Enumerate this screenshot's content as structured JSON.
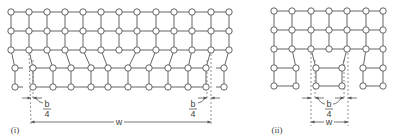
{
  "figure": {
    "colors": {
      "line": "#555555",
      "atom_fill": "#ffffff",
      "dashed": "#777777",
      "text": "#444444"
    },
    "panels": [
      {
        "id": "i",
        "label": "(i)",
        "label_pos": [
          15,
          133
        ],
        "atom_radius": 3.2,
        "rows": [
          {
            "y": 12,
            "x": [
              11,
              29,
              47,
              65,
              83,
              101,
              119,
              137,
              156,
              174,
              192,
              211,
              229
            ]
          },
          {
            "y": 31,
            "x": [
              11,
              29,
              47,
              65,
              83,
              101,
              119,
              137,
              156,
              174,
              192,
              211,
              229
            ]
          },
          {
            "y": 50,
            "x": [
              11,
              29,
              47,
              65,
              83,
              101,
              119,
              137,
              156,
              174,
              192,
              211,
              229
            ]
          },
          {
            "y": 68,
            "x": [
              15,
              33,
              53,
              71,
              91,
              108,
              128,
              149,
              168,
              188,
              206,
              224
            ]
          },
          {
            "y": 87,
            "x": [
              15,
              33,
              53,
              71,
              91,
              108,
              128,
              149,
              168,
              188,
              206,
              224
            ]
          }
        ],
        "row_gaps": [
          [],
          [],
          [],
          [
            0,
            10
          ],
          [
            0,
            10
          ]
        ],
        "gap_stubs": [
          {
            "x1": 15,
            "x2": 23,
            "rows": [
              3,
              4
            ]
          },
          {
            "x1": 216,
            "x2": 224,
            "rows": [
              3,
              4
            ]
          }
        ],
        "vertical_links_3_to_4": [
          [
            0,
            0
          ],
          [
            1,
            1
          ],
          [
            2,
            2
          ],
          [
            3,
            3
          ],
          [
            4,
            4
          ],
          [
            5,
            5
          ],
          [
            7,
            6
          ],
          [
            8,
            7
          ],
          [
            9,
            8
          ],
          [
            10,
            9
          ],
          [
            11,
            10
          ],
          [
            12,
            11
          ]
        ],
        "dashed_lines": [
          {
            "x1": 29,
            "y1": 50,
            "x2": 31,
            "y2": 124
          },
          {
            "x1": 33,
            "y1": 60,
            "x2": 33,
            "y2": 100
          },
          {
            "x1": 211,
            "y1": 50,
            "x2": 211,
            "y2": 126
          },
          {
            "x1": 207,
            "y1": 60,
            "x2": 207,
            "y2": 100
          }
        ],
        "b_markers": [
          {
            "y": 98,
            "left_x": 31,
            "right_x": 33,
            "text_b": "b",
            "text_4": "4",
            "text_x": 47,
            "leader": [
              [
                43,
                103
              ],
              [
                35,
                97
              ]
            ]
          },
          {
            "y": 98,
            "left_x": 207,
            "right_x": 211,
            "text_b": "b",
            "text_4": "4",
            "text_x": 193,
            "leader": [
              [
                198,
                103
              ],
              [
                206,
                97
              ]
            ]
          }
        ],
        "w_dimension": {
          "y": 122,
          "x1": 31,
          "x2": 211,
          "label": "w",
          "label_x": 119
        }
      },
      {
        "id": "ii",
        "label": "(ii)",
        "label_pos": [
          277,
          133
        ],
        "atom_radius": 3.2,
        "rows": [
          {
            "y": 11,
            "x": [
              274,
              292,
              311,
              329,
              347,
              366,
              383
            ]
          },
          {
            "y": 30,
            "x": [
              274,
              292,
              311,
              329,
              347,
              366,
              383
            ]
          },
          {
            "y": 49,
            "x": [
              274,
              292,
              311,
              329,
              347,
              366,
              383
            ]
          },
          {
            "y": 68,
            "x": [
              274,
              296,
              316,
              342,
              363,
              383
            ]
          },
          {
            "y": 86,
            "x": [
              274,
              296,
              316,
              342,
              363,
              383
            ]
          }
        ],
        "row_gaps": [
          [],
          [],
          [],
          [
            1,
            3
          ],
          [
            1,
            3
          ]
        ],
        "gap_stubs": [],
        "vertical_links_3_to_4": [
          [
            0,
            0
          ],
          [
            1,
            1
          ],
          [
            2,
            2
          ],
          [
            4,
            3
          ],
          [
            5,
            4
          ],
          [
            6,
            5
          ]
        ],
        "dashed_lines": [
          {
            "x1": 311,
            "y1": 49,
            "x2": 311,
            "y2": 126
          },
          {
            "x1": 315,
            "y1": 60,
            "x2": 315,
            "y2": 100
          },
          {
            "x1": 344,
            "y1": 60,
            "x2": 344,
            "y2": 100
          },
          {
            "x1": 348,
            "y1": 49,
            "x2": 348,
            "y2": 126
          }
        ],
        "b_markers": [
          {
            "y": 98,
            "left_x": 311,
            "right_x": 315,
            "text_b": "b",
            "text_4": "4",
            "text_x": 329,
            "leader": [
              [
                325,
                104
              ],
              [
                317,
                97
              ]
            ]
          },
          {
            "y": 98,
            "left_x": 344,
            "right_x": 348,
            "text_b": "",
            "text_4": "",
            "text_x": 329,
            "leader": [
              [
                333,
                104
              ],
              [
                342,
                97
              ]
            ]
          }
        ],
        "w_dimension": {
          "y": 122,
          "x1": 311,
          "x2": 348,
          "label": "w",
          "label_x": 329
        }
      }
    ]
  }
}
